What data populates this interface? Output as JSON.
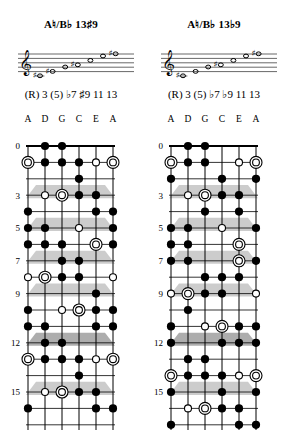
{
  "page": {
    "width": 285,
    "height": 434,
    "background": "#ffffff",
    "ink": "#000000",
    "marker_shade": "#c9c9c9"
  },
  "panels": [
    {
      "id": "left",
      "title": {
        "root": "A",
        "root_accidental": "♮",
        "separator": "/",
        "alt_root": "B",
        "alt_accidental": "♭",
        "quality_number": "13",
        "quality_accidental": "♯",
        "quality_extension": "9",
        "full": "A♮/B♭ 13♯9"
      },
      "staff": {
        "clef": "treble-clef",
        "lines": 5,
        "notes": [
          {
            "degree": "R",
            "accidental": "♯",
            "staff_pos": 0
          },
          {
            "degree": "3",
            "accidental": "♯",
            "staff_pos": 2
          },
          {
            "degree": "5",
            "accidental": "",
            "staff_pos": 4
          },
          {
            "degree": "b7",
            "accidental": "♯",
            "staff_pos": 5
          },
          {
            "degree": "#9",
            "accidental": "",
            "staff_pos": 7
          },
          {
            "degree": "11",
            "accidental": "",
            "staff_pos": 9
          },
          {
            "degree": "13",
            "accidental": "♯",
            "staff_pos": 10
          }
        ]
      },
      "degrees_line": "(R) 3 (5) ♭7 ♯9 11 13",
      "degrees_tokens": [
        "(R)",
        "3",
        "(5)",
        "♭7",
        "♯9",
        "11",
        "13"
      ],
      "string_names": [
        "A",
        "D",
        "G",
        "C",
        "E",
        "A"
      ],
      "fret_labels": [
        {
          "fret": 0,
          "label": "0"
        },
        {
          "fret": 3,
          "label": "3"
        },
        {
          "fret": 5,
          "label": "5"
        },
        {
          "fret": 7,
          "label": "7"
        },
        {
          "fret": 9,
          "label": "9"
        },
        {
          "fret": 12,
          "label": "12"
        },
        {
          "fret": 15,
          "label": "15"
        }
      ],
      "inlay_frets": [
        3,
        5,
        7,
        9,
        12,
        15
      ],
      "double_inlay_frets": [
        12
      ],
      "notes": [
        {
          "string": 2,
          "fret": 0,
          "type": "filled"
        },
        {
          "string": 3,
          "fret": 0,
          "type": "filled"
        },
        {
          "string": 1,
          "fret": 1,
          "type": "root"
        },
        {
          "string": 2,
          "fret": 1,
          "type": "filled"
        },
        {
          "string": 3,
          "fret": 1,
          "type": "filled"
        },
        {
          "string": 4,
          "fret": 1,
          "type": "filled"
        },
        {
          "string": 5,
          "fret": 1,
          "type": "open"
        },
        {
          "string": 6,
          "fret": 1,
          "type": "root"
        },
        {
          "string": 4,
          "fret": 2,
          "type": "filled"
        },
        {
          "string": 2,
          "fret": 3,
          "type": "open"
        },
        {
          "string": 3,
          "fret": 3,
          "type": "root"
        },
        {
          "string": 4,
          "fret": 3,
          "type": "filled"
        },
        {
          "string": 5,
          "fret": 3,
          "type": "filled"
        },
        {
          "string": 1,
          "fret": 4,
          "type": "filled"
        },
        {
          "string": 5,
          "fret": 4,
          "type": "filled"
        },
        {
          "string": 6,
          "fret": 4,
          "type": "filled"
        },
        {
          "string": 1,
          "fret": 5,
          "type": "filled"
        },
        {
          "string": 2,
          "fret": 5,
          "type": "filled"
        },
        {
          "string": 4,
          "fret": 5,
          "type": "open"
        },
        {
          "string": 6,
          "fret": 5,
          "type": "filled"
        },
        {
          "string": 1,
          "fret": 6,
          "type": "filled"
        },
        {
          "string": 2,
          "fret": 6,
          "type": "filled"
        },
        {
          "string": 3,
          "fret": 6,
          "type": "filled"
        },
        {
          "string": 5,
          "fret": 6,
          "type": "root"
        },
        {
          "string": 6,
          "fret": 6,
          "type": "filled"
        },
        {
          "string": 3,
          "fret": 7,
          "type": "filled"
        },
        {
          "string": 4,
          "fret": 7,
          "type": "filled"
        },
        {
          "string": 1,
          "fret": 8,
          "type": "open"
        },
        {
          "string": 2,
          "fret": 8,
          "type": "root"
        },
        {
          "string": 3,
          "fret": 8,
          "type": "filled"
        },
        {
          "string": 4,
          "fret": 8,
          "type": "filled"
        },
        {
          "string": 6,
          "fret": 8,
          "type": "open"
        },
        {
          "string": 5,
          "fret": 9,
          "type": "filled"
        },
        {
          "string": 1,
          "fret": 10,
          "type": "filled"
        },
        {
          "string": 3,
          "fret": 10,
          "type": "open"
        },
        {
          "string": 4,
          "fret": 10,
          "type": "root"
        },
        {
          "string": 5,
          "fret": 10,
          "type": "filled"
        },
        {
          "string": 6,
          "fret": 10,
          "type": "filled"
        },
        {
          "string": 1,
          "fret": 11,
          "type": "filled"
        },
        {
          "string": 2,
          "fret": 11,
          "type": "filled"
        },
        {
          "string": 5,
          "fret": 11,
          "type": "filled"
        },
        {
          "string": 6,
          "fret": 11,
          "type": "filled"
        },
        {
          "string": 2,
          "fret": 12,
          "type": "filled"
        },
        {
          "string": 3,
          "fret": 12,
          "type": "filled"
        },
        {
          "string": 1,
          "fret": 13,
          "type": "root"
        },
        {
          "string": 2,
          "fret": 13,
          "type": "filled"
        },
        {
          "string": 3,
          "fret": 13,
          "type": "filled"
        },
        {
          "string": 4,
          "fret": 13,
          "type": "filled"
        },
        {
          "string": 5,
          "fret": 13,
          "type": "open"
        },
        {
          "string": 6,
          "fret": 13,
          "type": "root"
        },
        {
          "string": 4,
          "fret": 14,
          "type": "filled"
        },
        {
          "string": 2,
          "fret": 15,
          "type": "open"
        },
        {
          "string": 3,
          "fret": 15,
          "type": "root"
        },
        {
          "string": 4,
          "fret": 15,
          "type": "filled"
        },
        {
          "string": 5,
          "fret": 15,
          "type": "filled"
        },
        {
          "string": 1,
          "fret": 16,
          "type": "filled"
        },
        {
          "string": 5,
          "fret": 16,
          "type": "filled"
        },
        {
          "string": 6,
          "fret": 16,
          "type": "filled"
        }
      ]
    },
    {
      "id": "right",
      "title": {
        "root": "A",
        "root_accidental": "♮",
        "separator": "/",
        "alt_root": "B",
        "alt_accidental": "♭",
        "quality_number": "13",
        "quality_accidental": "♭",
        "quality_extension": "9",
        "full": "A♮/B♭ 13♭9"
      },
      "staff": {
        "clef": "treble-clef",
        "lines": 5,
        "notes": [
          {
            "degree": "R",
            "accidental": "♯",
            "staff_pos": 0
          },
          {
            "degree": "3",
            "accidental": "",
            "staff_pos": 2
          },
          {
            "degree": "5",
            "accidental": "",
            "staff_pos": 4
          },
          {
            "degree": "b7",
            "accidental": "♯",
            "staff_pos": 5
          },
          {
            "degree": "b9",
            "accidental": "",
            "staff_pos": 7
          },
          {
            "degree": "11",
            "accidental": "",
            "staff_pos": 9
          },
          {
            "degree": "13",
            "accidental": "♯",
            "staff_pos": 10
          }
        ]
      },
      "degrees_line": "(R) 3 (5) ♭7 ♭9 11 13",
      "degrees_tokens": [
        "(R)",
        "3",
        "(5)",
        "♭7",
        "♭9",
        "11",
        "13"
      ],
      "string_names": [
        "A",
        "D",
        "G",
        "C",
        "E",
        "A"
      ],
      "fret_labels": [
        {
          "fret": 0,
          "label": "0"
        },
        {
          "fret": 3,
          "label": "3"
        },
        {
          "fret": 5,
          "label": "5"
        },
        {
          "fret": 7,
          "label": "7"
        },
        {
          "fret": 9,
          "label": "9"
        },
        {
          "fret": 12,
          "label": "12"
        },
        {
          "fret": 15,
          "label": "15"
        }
      ],
      "inlay_frets": [
        3,
        5,
        7,
        9,
        12,
        15
      ],
      "double_inlay_frets": [
        12
      ],
      "notes": [
        {
          "string": 2,
          "fret": 0,
          "type": "filled"
        },
        {
          "string": 3,
          "fret": 0,
          "type": "filled"
        },
        {
          "string": 1,
          "fret": 1,
          "type": "root"
        },
        {
          "string": 2,
          "fret": 1,
          "type": "filled"
        },
        {
          "string": 3,
          "fret": 1,
          "type": "filled"
        },
        {
          "string": 5,
          "fret": 1,
          "type": "open"
        },
        {
          "string": 6,
          "fret": 1,
          "type": "root"
        },
        {
          "string": 1,
          "fret": 2,
          "type": "filled"
        },
        {
          "string": 4,
          "fret": 2,
          "type": "filled"
        },
        {
          "string": 6,
          "fret": 2,
          "type": "filled"
        },
        {
          "string": 2,
          "fret": 3,
          "type": "open"
        },
        {
          "string": 3,
          "fret": 3,
          "type": "root"
        },
        {
          "string": 4,
          "fret": 3,
          "type": "filled"
        },
        {
          "string": 5,
          "fret": 3,
          "type": "filled"
        },
        {
          "string": 3,
          "fret": 4,
          "type": "filled"
        },
        {
          "string": 5,
          "fret": 4,
          "type": "filled"
        },
        {
          "string": 1,
          "fret": 5,
          "type": "filled"
        },
        {
          "string": 2,
          "fret": 5,
          "type": "filled"
        },
        {
          "string": 4,
          "fret": 5,
          "type": "open"
        },
        {
          "string": 6,
          "fret": 5,
          "type": "filled"
        },
        {
          "string": 1,
          "fret": 6,
          "type": "filled"
        },
        {
          "string": 2,
          "fret": 6,
          "type": "filled"
        },
        {
          "string": 5,
          "fret": 6,
          "type": "root"
        },
        {
          "string": 1,
          "fret": 7,
          "type": "filled"
        },
        {
          "string": 2,
          "fret": 7,
          "type": "filled"
        },
        {
          "string": 5,
          "fret": 7,
          "type": "root"
        },
        {
          "string": 6,
          "fret": 7,
          "type": "filled"
        },
        {
          "string": 3,
          "fret": 8,
          "type": "filled"
        },
        {
          "string": 4,
          "fret": 8,
          "type": "filled"
        },
        {
          "string": 5,
          "fret": 8,
          "type": "filled"
        },
        {
          "string": 1,
          "fret": 9,
          "type": "open"
        },
        {
          "string": 2,
          "fret": 9,
          "type": "root"
        },
        {
          "string": 3,
          "fret": 9,
          "type": "filled"
        },
        {
          "string": 4,
          "fret": 9,
          "type": "filled"
        },
        {
          "string": 6,
          "fret": 9,
          "type": "open"
        },
        {
          "string": 2,
          "fret": 10,
          "type": "filled"
        },
        {
          "string": 1,
          "fret": 11,
          "type": "filled"
        },
        {
          "string": 3,
          "fret": 11,
          "type": "open"
        },
        {
          "string": 4,
          "fret": 11,
          "type": "root"
        },
        {
          "string": 5,
          "fret": 11,
          "type": "filled"
        },
        {
          "string": 6,
          "fret": 11,
          "type": "filled"
        },
        {
          "string": 1,
          "fret": 12,
          "type": "filled"
        },
        {
          "string": 4,
          "fret": 12,
          "type": "filled"
        },
        {
          "string": 5,
          "fret": 12,
          "type": "filled"
        },
        {
          "string": 6,
          "fret": 12,
          "type": "filled"
        },
        {
          "string": 2,
          "fret": 13,
          "type": "filled"
        },
        {
          "string": 3,
          "fret": 13,
          "type": "filled"
        },
        {
          "string": 1,
          "fret": 14,
          "type": "root"
        },
        {
          "string": 2,
          "fret": 14,
          "type": "filled"
        },
        {
          "string": 3,
          "fret": 14,
          "type": "filled"
        },
        {
          "string": 4,
          "fret": 14,
          "type": "filled"
        },
        {
          "string": 5,
          "fret": 14,
          "type": "open"
        },
        {
          "string": 6,
          "fret": 14,
          "type": "root"
        },
        {
          "string": 1,
          "fret": 15,
          "type": "filled"
        },
        {
          "string": 4,
          "fret": 15,
          "type": "filled"
        },
        {
          "string": 6,
          "fret": 15,
          "type": "filled"
        },
        {
          "string": 2,
          "fret": 16,
          "type": "open"
        },
        {
          "string": 3,
          "fret": 16,
          "type": "root"
        },
        {
          "string": 4,
          "fret": 16,
          "type": "filled"
        },
        {
          "string": 5,
          "fret": 16,
          "type": "filled"
        },
        {
          "string": 1,
          "fret": 17,
          "type": "filled"
        },
        {
          "string": 5,
          "fret": 17,
          "type": "filled"
        },
        {
          "string": 6,
          "fret": 17,
          "type": "filled"
        }
      ]
    }
  ],
  "legend": {
    "filled": "scale-tone",
    "open": "optional-tone",
    "root": "root-tone"
  }
}
